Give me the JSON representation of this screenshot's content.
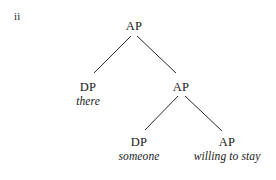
{
  "figure": {
    "example_label": "ii",
    "ink_color": "#1a1a1a",
    "background_color": "#ffffff",
    "line_color": "#2b2b2b"
  },
  "tree": {
    "nodes": [
      {
        "id": "root",
        "label": "AP",
        "word": "",
        "x": 134,
        "y": 20
      },
      {
        "id": "dp-there",
        "label": "DP",
        "word": "there",
        "x": 88,
        "y": 81
      },
      {
        "id": "ap-inner",
        "label": "AP",
        "word": "",
        "x": 181,
        "y": 81
      },
      {
        "id": "dp-someone",
        "label": "DP",
        "word": "someone",
        "x": 139,
        "y": 136
      },
      {
        "id": "ap-willing",
        "label": "AP",
        "word": "willing to stay",
        "x": 227,
        "y": 136
      }
    ],
    "edges": [
      {
        "from": "root",
        "to": "dp-there",
        "x1": 131,
        "y1": 36,
        "x2": 94,
        "y2": 73
      },
      {
        "from": "root",
        "to": "ap-inner",
        "x1": 137,
        "y1": 36,
        "x2": 176,
        "y2": 73
      },
      {
        "from": "ap-inner",
        "to": "dp-someone",
        "x1": 178,
        "y1": 96,
        "x2": 145,
        "y2": 130
      },
      {
        "from": "ap-inner",
        "to": "ap-willing",
        "x1": 185,
        "y1": 96,
        "x2": 222,
        "y2": 131
      }
    ]
  }
}
